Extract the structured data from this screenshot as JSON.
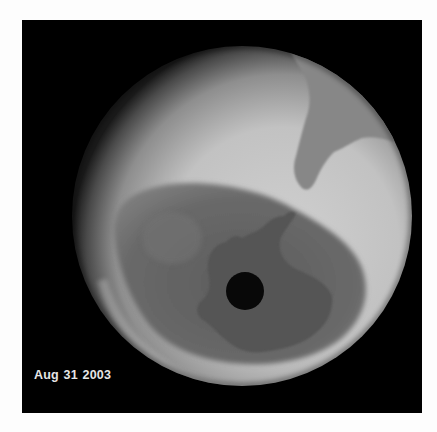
{
  "image": {
    "description": "Satellite false-color (grayscale) globe view of the Antarctic ozone hole",
    "date_label": "Aug 31 2003",
    "colors": {
      "background": "#000000",
      "globe_bright": "#c8c8c8",
      "globe_mid": "#a9a9a9",
      "ozone_hole": "#6a6a6a",
      "continent": "#585858",
      "pole_hole": "#0a0a0a",
      "label": "#e6e6e6"
    }
  }
}
